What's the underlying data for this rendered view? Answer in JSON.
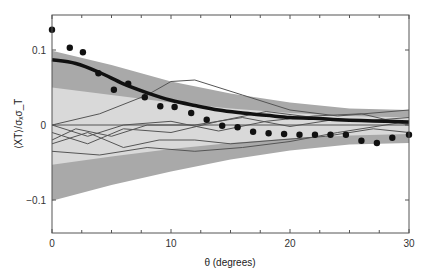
{
  "chart_data": {
    "type": "line",
    "title": "",
    "xlabel": "θ (degrees)",
    "ylabel": "⟨XT⟩/σₓσ_T",
    "xlim": [
      0,
      30
    ],
    "ylim": [
      -0.145,
      0.145
    ],
    "xticks": [
      0,
      10,
      20,
      30
    ],
    "xtick_labels": [
      "0",
      "10",
      "20",
      "30"
    ],
    "yticks": [
      -0.1,
      0,
      0.1
    ],
    "ytick_labels": [
      "−0.1",
      "0",
      "0.1"
    ],
    "grid": false,
    "legend": "none",
    "colors": {
      "outer_band": "#a9a9a9",
      "inner_band": "#d9d9d9",
      "mean_curve": "#111111",
      "realizations": "#555555",
      "points": "#111111",
      "axes": "#555555"
    },
    "series": [
      {
        "name": "outer-confidence-band",
        "kind": "band",
        "x": [
          0,
          5,
          10,
          15,
          20,
          25,
          30
        ],
        "upper": [
          0.099,
          0.08,
          0.058,
          0.042,
          0.03,
          0.022,
          0.02
        ],
        "lower": [
          -0.101,
          -0.08,
          -0.062,
          -0.046,
          -0.034,
          -0.026,
          -0.024
        ]
      },
      {
        "name": "inner-confidence-band",
        "kind": "band",
        "x": [
          0,
          5,
          10,
          15,
          20,
          25,
          30
        ],
        "upper": [
          0.05,
          0.04,
          0.03,
          0.022,
          0.016,
          0.012,
          0.01
        ],
        "lower": [
          -0.053,
          -0.042,
          -0.032,
          -0.024,
          -0.018,
          -0.014,
          -0.012
        ]
      },
      {
        "name": "model-mean",
        "kind": "line",
        "x": [
          0,
          2,
          4,
          6,
          8,
          10,
          12,
          14,
          16,
          18,
          20,
          22,
          24,
          26,
          28,
          30
        ],
        "values": [
          0.087,
          0.082,
          0.07,
          0.055,
          0.043,
          0.033,
          0.026,
          0.02,
          0.016,
          0.013,
          0.01,
          0.009,
          0.007,
          0.006,
          0.005,
          0.004
        ]
      },
      {
        "name": "data-points",
        "kind": "scatter",
        "x": [
          0,
          1.5,
          2.6,
          3.9,
          5.2,
          6.4,
          7.8,
          9.1,
          10.3,
          11.7,
          13.0,
          14.3,
          15.6,
          16.9,
          18.2,
          19.5,
          20.8,
          22.1,
          23.4,
          24.7,
          26.0,
          27.3,
          28.6,
          30.0
        ],
        "values": [
          0.127,
          0.103,
          0.097,
          0.069,
          0.047,
          0.055,
          0.037,
          0.025,
          0.024,
          0.016,
          0.007,
          -0.001,
          -0.003,
          -0.009,
          -0.011,
          -0.012,
          -0.013,
          -0.013,
          -0.013,
          -0.013,
          -0.021,
          -0.024,
          -0.017,
          -0.013
        ]
      },
      {
        "name": "realization-1",
        "kind": "line",
        "x": [
          0,
          4,
          8,
          10,
          12,
          16,
          20,
          24,
          30
        ],
        "values": [
          0.0,
          0.015,
          0.04,
          0.058,
          0.06,
          0.04,
          0.02,
          0.012,
          0.02
        ]
      },
      {
        "name": "realization-2",
        "kind": "line",
        "x": [
          0,
          3,
          6,
          10,
          14,
          18,
          22,
          26,
          30
        ],
        "values": [
          -0.01,
          -0.025,
          -0.005,
          -0.01,
          0.005,
          0.018,
          0.01,
          0.005,
          0.01
        ]
      },
      {
        "name": "realization-3",
        "kind": "line",
        "x": [
          0,
          2,
          5,
          8,
          12,
          16,
          20,
          24,
          30
        ],
        "values": [
          -0.02,
          -0.005,
          -0.015,
          0.0,
          0.0,
          0.01,
          -0.002,
          0.008,
          0.002
        ]
      },
      {
        "name": "realization-4",
        "kind": "line",
        "x": [
          0,
          3,
          6,
          9,
          12,
          15,
          19,
          23,
          27,
          30
        ],
        "values": [
          -0.025,
          -0.01,
          -0.03,
          -0.02,
          -0.02,
          -0.025,
          -0.02,
          -0.015,
          -0.005,
          -0.01
        ]
      },
      {
        "name": "realization-5",
        "kind": "line",
        "x": [
          0,
          4,
          8,
          12,
          16,
          20,
          24,
          30
        ],
        "values": [
          -0.035,
          -0.04,
          -0.03,
          -0.035,
          -0.03,
          -0.022,
          -0.01,
          0.005
        ]
      },
      {
        "name": "realization-6",
        "kind": "line",
        "x": [
          0,
          3,
          6,
          10,
          14,
          18,
          22,
          26,
          30
        ],
        "values": [
          0.0,
          -0.015,
          0.0,
          0.005,
          -0.008,
          0.005,
          0.012,
          0.015,
          0.0
        ]
      },
      {
        "name": "zero-reference",
        "kind": "hline",
        "values": [
          0
        ]
      }
    ]
  }
}
